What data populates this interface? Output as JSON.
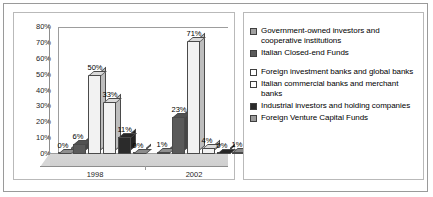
{
  "chart_data": {
    "type": "bar",
    "title": "",
    "subtitle": "",
    "xlabel": "",
    "ylabel": "",
    "categories": [
      "1998",
      "2002"
    ],
    "ylim": [
      0,
      80
    ],
    "ytick_labels": [
      "0%",
      "10%",
      "20%",
      "30%",
      "40%",
      "50%",
      "60%",
      "70%",
      "80%"
    ],
    "ytick_values": [
      0,
      10,
      20,
      30,
      40,
      50,
      60,
      70,
      80
    ],
    "grid": false,
    "legend_position": "right",
    "three_d": true,
    "value_suffix": "%",
    "series": [
      {
        "name": "Government-owned investors and cooperative institutions",
        "values": [
          0,
          1
        ],
        "labels": [
          "0%",
          "1%"
        ],
        "color": "#a0a0a0"
      },
      {
        "name": "Italian Closed-end Funds",
        "values": [
          6,
          23
        ],
        "labels": [
          "6%",
          "23%"
        ],
        "color": "#5a5a5a"
      },
      {
        "name": "Foreign investment banks and global banks",
        "values": [
          50,
          71
        ],
        "labels": [
          "50%",
          "71%"
        ],
        "color": "#f2f2f2"
      },
      {
        "name": "Italian commercial banks and merchant banks",
        "values": [
          33,
          4
        ],
        "labels": [
          "33%",
          "4%"
        ],
        "color": "#f2f2f2"
      },
      {
        "name": "Industrial investors and holding companies",
        "values": [
          11,
          0
        ],
        "labels": [
          "11%",
          "0%"
        ],
        "color": "#2b2b2b"
      },
      {
        "name": "Foreign Venture Capital Funds",
        "values": [
          0,
          1
        ],
        "labels": [
          "0%",
          "1%"
        ],
        "color": "#9a9a9a"
      }
    ]
  },
  "legend": {
    "items": [
      {
        "label": "Government-owned investors and cooperative institutions",
        "swatch": "#a0a0a0"
      },
      {
        "label": "Italian Closed-end Funds",
        "swatch": "#5a5a5a"
      },
      {
        "label": "Foreign investment banks and global banks",
        "swatch": "#ffffff"
      },
      {
        "label": "Italian commercial banks and merchant banks",
        "swatch": "#ffffff"
      },
      {
        "label": "Industrial investors and holding companies",
        "swatch": "#2b2b2b"
      },
      {
        "label": "Foreign Venture Capital Funds",
        "swatch": "#9a9a9a"
      }
    ]
  }
}
